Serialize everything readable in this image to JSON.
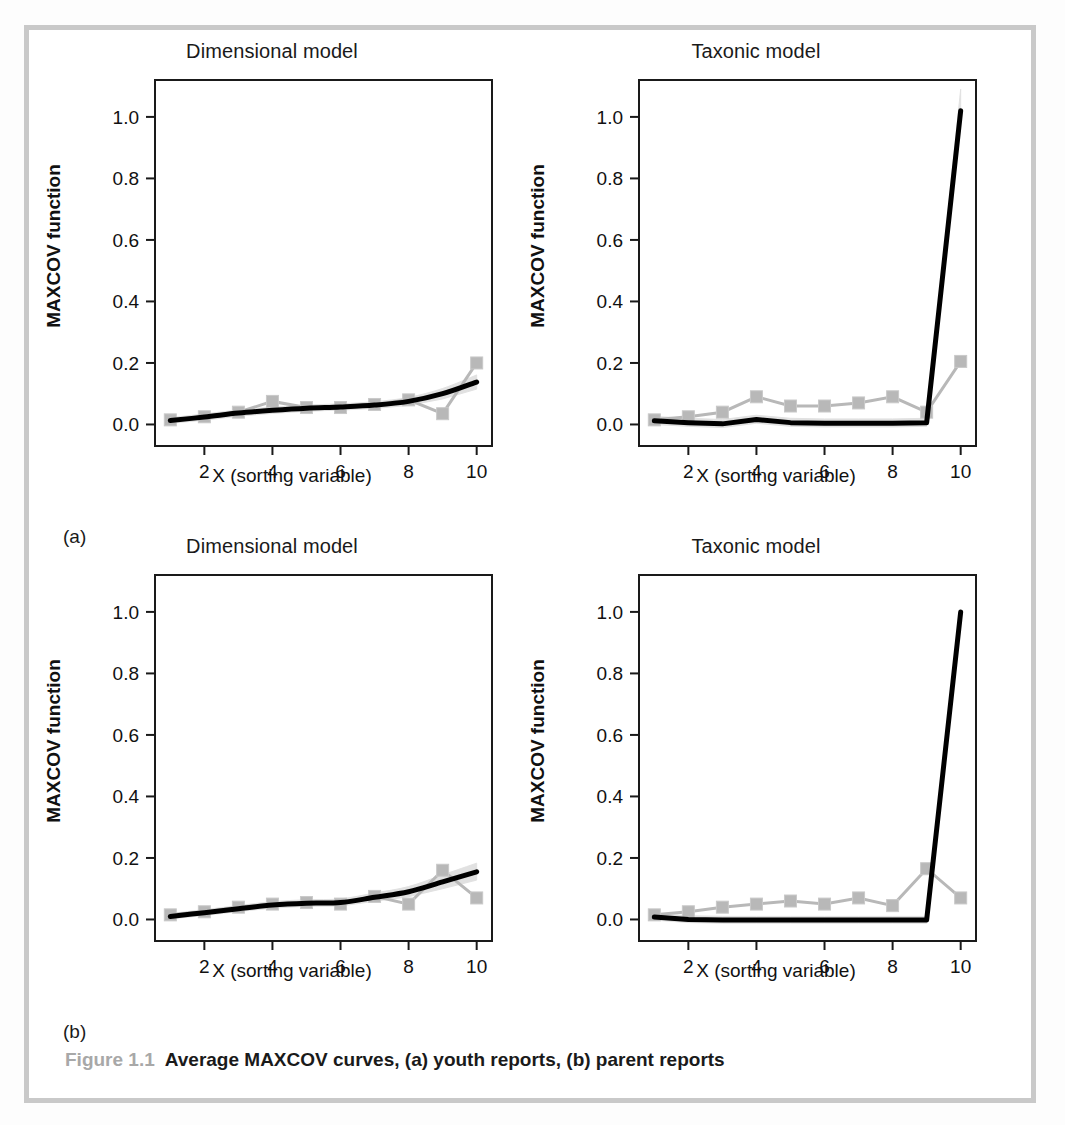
{
  "figure": {
    "caption_number": "Figure 1.1",
    "caption_text": "Average MAXCOV curves, (a) youth reports, (b) parent reports",
    "subpanel_a_label": "(a)",
    "subpanel_b_label": "(b)",
    "frame_color": "#c9c9c9",
    "curve_color": "#000000",
    "marker_color": "#b8b8b8",
    "band_color": "#e0e0e0"
  },
  "axes_common": {
    "xlabel": "X (sorting variable)",
    "ylabel": "MAXCOV function",
    "xticks": [
      "2",
      "4",
      "6",
      "8",
      "10"
    ],
    "xtick_values": [
      2,
      4,
      6,
      8,
      10
    ],
    "yticks": [
      "0.0",
      "0.2",
      "0.4",
      "0.6",
      "0.8",
      "1.0"
    ],
    "ytick_values": [
      0.0,
      0.2,
      0.4,
      0.6,
      0.8,
      1.0
    ],
    "xlim": [
      0.55,
      10.45
    ],
    "ylim": [
      -0.07,
      1.12
    ],
    "grid": false,
    "legend": "none"
  },
  "chart_data": [
    {
      "id": "a-dimensional",
      "type": "line",
      "panel": "(a) youth reports",
      "title": "Dimensional model",
      "xlabel": "X (sorting variable)",
      "ylabel": "MAXCOV function",
      "xlim": [
        0.55,
        10.45
      ],
      "ylim": [
        -0.07,
        1.12
      ],
      "grid": false,
      "x": [
        1,
        2,
        3,
        4,
        5,
        6,
        7,
        8,
        9,
        10
      ],
      "series": [
        {
          "name": "Observed average MAXCOV curve",
          "style": "line-with-square-markers",
          "color": "#b8b8b8",
          "values": [
            0.015,
            0.025,
            0.04,
            0.075,
            0.055,
            0.055,
            0.065,
            0.08,
            0.035,
            0.2
          ]
        },
        {
          "name": "Simulated dimensional comparison curve",
          "style": "thick-smooth-line",
          "color": "#000000",
          "values": [
            0.013,
            0.024,
            0.037,
            0.046,
            0.053,
            0.057,
            0.063,
            0.075,
            0.1,
            0.138
          ]
        },
        {
          "name": "Confidence band around simulated curve",
          "style": "shaded-band",
          "color": "#e0e0e0",
          "lower": [
            0.004,
            0.014,
            0.027,
            0.036,
            0.043,
            0.047,
            0.052,
            0.062,
            0.083,
            0.115
          ],
          "upper": [
            0.022,
            0.034,
            0.047,
            0.056,
            0.063,
            0.067,
            0.074,
            0.088,
            0.117,
            0.161
          ]
        }
      ]
    },
    {
      "id": "a-taxonic",
      "type": "line",
      "panel": "(a) youth reports",
      "title": "Taxonic model",
      "xlabel": "X (sorting variable)",
      "ylabel": "MAXCOV function",
      "xlim": [
        0.55,
        10.45
      ],
      "ylim": [
        -0.07,
        1.12
      ],
      "grid": false,
      "x": [
        1,
        2,
        3,
        4,
        5,
        6,
        7,
        8,
        9,
        10
      ],
      "series": [
        {
          "name": "Observed average MAXCOV curve",
          "style": "line-with-square-markers",
          "color": "#b8b8b8",
          "values": [
            0.015,
            0.025,
            0.04,
            0.09,
            0.06,
            0.06,
            0.07,
            0.09,
            0.04,
            0.205
          ]
        },
        {
          "name": "Simulated taxonic comparison curve",
          "style": "thick-smooth-line",
          "color": "#000000",
          "values": [
            0.012,
            0.006,
            0.002,
            0.016,
            0.006,
            0.004,
            0.004,
            0.004,
            0.006,
            1.02
          ]
        },
        {
          "name": "Confidence band around simulated curve",
          "style": "shaded-band",
          "color": "#e0e0e0",
          "lower": [
            0.0,
            -0.006,
            -0.01,
            0.004,
            -0.006,
            -0.008,
            -0.008,
            -0.008,
            -0.006,
            0.98
          ],
          "upper": [
            0.026,
            0.02,
            0.016,
            0.03,
            0.02,
            0.018,
            0.018,
            0.018,
            0.02,
            1.09
          ]
        }
      ]
    },
    {
      "id": "b-dimensional",
      "type": "line",
      "panel": "(b) parent reports",
      "title": "Dimensional model",
      "xlabel": "X (sorting variable)",
      "ylabel": "MAXCOV function",
      "xlim": [
        0.55,
        10.45
      ],
      "ylim": [
        -0.07,
        1.12
      ],
      "grid": false,
      "x": [
        1,
        2,
        3,
        4,
        5,
        6,
        7,
        8,
        9,
        10
      ],
      "series": [
        {
          "name": "Observed average MAXCOV curve",
          "style": "line-with-square-markers",
          "color": "#b8b8b8",
          "values": [
            0.015,
            0.025,
            0.04,
            0.05,
            0.055,
            0.05,
            0.075,
            0.05,
            0.16,
            0.07
          ]
        },
        {
          "name": "Simulated dimensional comparison curve",
          "style": "thick-smooth-line",
          "color": "#000000",
          "values": [
            0.01,
            0.022,
            0.035,
            0.047,
            0.053,
            0.055,
            0.072,
            0.09,
            0.122,
            0.155
          ]
        },
        {
          "name": "Confidence band around simulated curve",
          "style": "shaded-band",
          "color": "#e0e0e0",
          "lower": [
            0.002,
            0.013,
            0.026,
            0.037,
            0.043,
            0.044,
            0.059,
            0.074,
            0.1,
            0.128
          ],
          "upper": [
            0.019,
            0.032,
            0.045,
            0.058,
            0.064,
            0.067,
            0.086,
            0.107,
            0.145,
            0.183
          ]
        }
      ]
    },
    {
      "id": "b-taxonic",
      "type": "line",
      "panel": "(b) parent reports",
      "title": "Taxonic model",
      "xlabel": "X (sorting variable)",
      "ylabel": "MAXCOV function",
      "xlim": [
        0.55,
        10.45
      ],
      "ylim": [
        -0.07,
        1.12
      ],
      "grid": false,
      "x": [
        1,
        2,
        3,
        4,
        5,
        6,
        7,
        8,
        9,
        10
      ],
      "series": [
        {
          "name": "Observed average MAXCOV curve",
          "style": "line-with-square-markers",
          "color": "#b8b8b8",
          "values": [
            0.015,
            0.025,
            0.04,
            0.05,
            0.06,
            0.05,
            0.07,
            0.045,
            0.165,
            0.07
          ]
        },
        {
          "name": "Simulated taxonic comparison curve",
          "style": "thick-smooth-line",
          "color": "#000000",
          "values": [
            0.008,
            0.0,
            -0.002,
            -0.002,
            -0.002,
            -0.002,
            -0.002,
            -0.002,
            -0.002,
            1.0
          ]
        },
        {
          "name": "Confidence band around simulated curve",
          "style": "shaded-band",
          "color": "#e0e0e0",
          "lower": [
            -0.002,
            -0.01,
            -0.012,
            -0.012,
            -0.012,
            -0.012,
            -0.012,
            -0.012,
            -0.012,
            0.96
          ]
        }
      ]
    }
  ],
  "panels": [
    {
      "key": "a-dimensional",
      "title": "Dimensional model"
    },
    {
      "key": "a-taxonic",
      "title": "Taxonic model"
    },
    {
      "key": "b-dimensional",
      "title": "Dimensional model"
    },
    {
      "key": "b-taxonic",
      "title": "Taxonic model"
    }
  ]
}
